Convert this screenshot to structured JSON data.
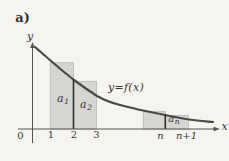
{
  "figure": {
    "part_label": "a)",
    "curve_label": "y=f(x)",
    "axes": {
      "y_axis_label": "y",
      "x_axis_label": "x",
      "origin_label": "0",
      "x_tick_labels": [
        "1",
        "2",
        "3",
        "n",
        "n+1"
      ]
    },
    "area_labels": {
      "a1": {
        "base": "a",
        "sub": "1"
      },
      "a2": {
        "base": "a",
        "sub": "2"
      },
      "an": {
        "base": "a",
        "sub": "n"
      }
    },
    "colors": {
      "background": "#f5f4f1",
      "rect_fill": "#d6d5d2",
      "rect_border": "#bab9b6",
      "curve": "#4a4946",
      "axis": "#55544f",
      "emphasis_line": "#2e2d2a",
      "text": "#35342f"
    }
  }
}
